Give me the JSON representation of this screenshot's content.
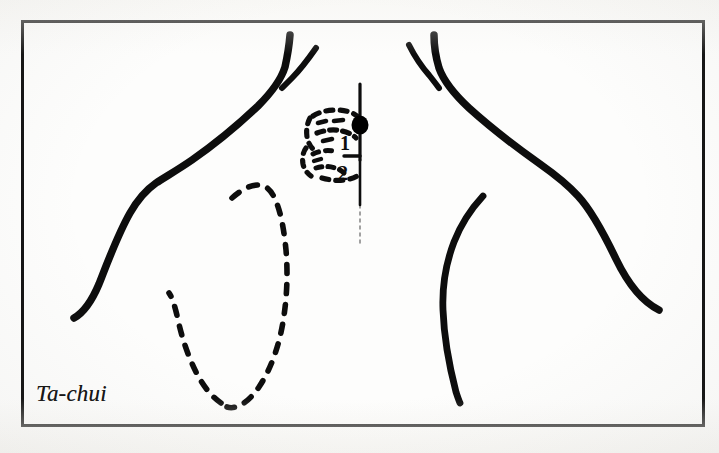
{
  "figure": {
    "caption": "Ta-chui",
    "kind": "acupuncture-point-illustration",
    "view": "posterior upper back and shoulders",
    "frame": {
      "x": 22,
      "y": 21,
      "width": 681,
      "height": 404,
      "stroke_color": "#111111"
    },
    "ink_color": "#0d0d0d",
    "paper_color": "#fdfdfc"
  },
  "point_marker": {
    "name": "Ta-chui",
    "shape": "filled-dot",
    "cx": 360,
    "cy": 125,
    "r": 8,
    "color": "#000000"
  },
  "midline": {
    "label": "spinal midline",
    "x": 360,
    "y_top": 84,
    "y_bottom": 243
  },
  "vertebra_labels": [
    {
      "text": "1",
      "x": 345,
      "y": 143
    },
    {
      "text": "2",
      "x": 341,
      "y": 175
    }
  ],
  "anatomy_parts": [
    {
      "name": "left-neck-trapezius-contour",
      "style": "solid"
    },
    {
      "name": "left-neck-fork-branch",
      "style": "solid"
    },
    {
      "name": "right-neck-trapezius-contour",
      "style": "solid"
    },
    {
      "name": "right-neck-fork-branch",
      "style": "solid"
    },
    {
      "name": "right-inner-arm-contour",
      "style": "solid"
    },
    {
      "name": "vertebrae-cluster-outline",
      "style": "dashed"
    },
    {
      "name": "scapula-outline",
      "style": "dashed"
    }
  ]
}
